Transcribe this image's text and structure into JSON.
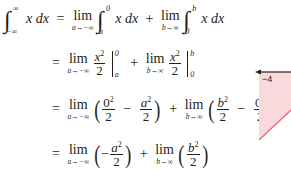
{
  "equation": {
    "line1": {
      "lhs_upper": "∞",
      "lhs_lower": "−∞",
      "integrand": "x dx",
      "lim1": "a→−∞",
      "int1_upper": "0",
      "int1_lower": "a",
      "lim2": "b→∞",
      "int2_upper": "b",
      "int2_lower": "0"
    },
    "line2": {
      "lim1": "a→−∞",
      "lim2": "b→∞",
      "eval1_upper": "0",
      "eval1_lower": "a",
      "eval2_upper": "b",
      "eval2_lower": "0"
    },
    "line3": {
      "lim1": "a→−∞",
      "lim2": "b→∞"
    },
    "line4": {
      "lim1": "a→−∞",
      "lim2": "b→∞"
    },
    "lim_word": "lim",
    "equals": "=",
    "plus": "+",
    "minus": "−",
    "two": "2"
  },
  "figure": {
    "axis_label": "−4",
    "fill_color": "#f9d9dc",
    "line_color": "#e26b7f",
    "axis_color": "#231f20"
  }
}
